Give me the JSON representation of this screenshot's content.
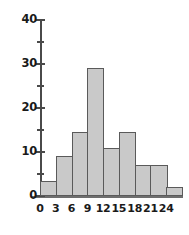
{
  "chart_data": {
    "type": "bar",
    "title": "",
    "xlabel": "",
    "ylabel": "",
    "grid": false,
    "legend": null,
    "bin_width": 3,
    "bin_edges": [
      0,
      3,
      6,
      9,
      12,
      15,
      18,
      21,
      24,
      27
    ],
    "categories": [
      "0-3",
      "3-6",
      "6-9",
      "9-12",
      "12-15",
      "15-18",
      "18-21",
      "21-24",
      "24-27"
    ],
    "values": [
      3.5,
      9,
      14.5,
      29,
      11,
      14.5,
      7,
      7,
      2
    ],
    "xlim": [
      0,
      27
    ],
    "ylim": [
      0,
      40
    ],
    "x_tick_labels": [
      "0",
      "3",
      "6",
      "9",
      "12",
      "15",
      "18",
      "21",
      "24"
    ],
    "x_tick_values": [
      0,
      3,
      6,
      9,
      12,
      15,
      18,
      21,
      24
    ],
    "y_tick_labels": [
      "0",
      "10",
      "20",
      "30",
      "40"
    ],
    "y_tick_values": [
      0,
      10,
      20,
      30,
      40
    ],
    "y_minor_tick_values": [
      5,
      15,
      25,
      35
    ],
    "colors": {
      "bar_fill": "#c9c9c9",
      "bar_border": "#5a5a5a",
      "axis": "#4a4a4a",
      "text": "#1a1a1a",
      "background": "#ffffff"
    }
  }
}
